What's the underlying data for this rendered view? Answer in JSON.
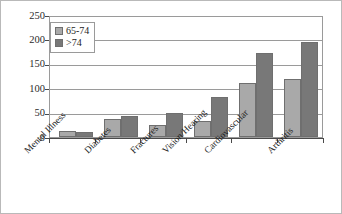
{
  "chart_data": {
    "type": "bar",
    "title": "",
    "xlabel": "",
    "ylabel": "",
    "ylim": [
      0,
      250
    ],
    "yticks": [
      0,
      50,
      100,
      150,
      200,
      250
    ],
    "ytick_labels": [
      "0",
      "50",
      "100",
      "150",
      "200",
      "250"
    ],
    "grid": true,
    "legend_position": "top-left",
    "categories": [
      "Mental Illness",
      "Diabetes",
      "Fractures",
      "Vision/Hearing",
      "Cardiovascular",
      "Arthritis"
    ],
    "series": [
      {
        "name": "65-74",
        "color": "#a9a9a9",
        "values": [
          12,
          38,
          26,
          33,
          112,
          120
        ]
      },
      {
        "name": ">74",
        "color": "#787878",
        "values": [
          11,
          43,
          50,
          83,
          175,
          197
        ]
      }
    ]
  }
}
